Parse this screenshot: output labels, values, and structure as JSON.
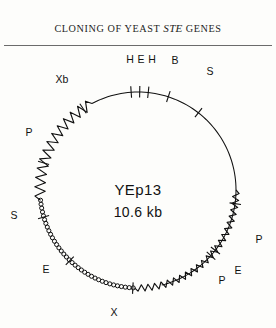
{
  "header": {
    "running_head_prefix": "CLONING OF YEAST ",
    "running_head_italic": "STE",
    "running_head_suffix": " GENES",
    "rule_color": "#6b6b6b"
  },
  "figure": {
    "plasmid_name": "YEp13",
    "plasmid_size": "10.6 kb",
    "stroke_color": "#111111",
    "background": "#fdfdfb",
    "circle": {
      "cx": 138,
      "cy": 142,
      "r": 98
    },
    "segment_styles": [
      {
        "name": "smooth-line",
        "description": "plain thin circle arc",
        "from_deg": -76,
        "to_deg": 118
      },
      {
        "name": "beaded-chain",
        "description": "chain of small open circles",
        "from_deg": 186,
        "to_deg": 268
      },
      {
        "name": "zigzag-large",
        "description": "large amplitude zig-zag",
        "from_deg": 118,
        "to_deg": 186
      },
      {
        "name": "zigzag-small",
        "description": "small amplitude wave",
        "from_deg": 268,
        "to_deg": 360
      }
    ],
    "site_labels": [
      {
        "id": "site-h-left",
        "text": "H",
        "angle_deg": 84,
        "x": 130,
        "y": 12
      },
      {
        "id": "site-e-top",
        "text": "E",
        "angle_deg": 89,
        "x": 141,
        "y": 12
      },
      {
        "id": "site-h-right",
        "text": "H",
        "angle_deg": 94,
        "x": 152,
        "y": 12
      },
      {
        "id": "site-b",
        "text": "B",
        "angle_deg": 72,
        "x": 175,
        "y": 13
      },
      {
        "id": "site-s-upper-right",
        "text": "S",
        "angle_deg": 52,
        "x": 210,
        "y": 24
      },
      {
        "id": "site-p-right",
        "text": "P",
        "angle_deg": 352,
        "x": 259,
        "y": 192
      },
      {
        "id": "site-p-lower-right",
        "text": "P",
        "angle_deg": 318,
        "x": 222,
        "y": 233
      },
      {
        "id": "site-e-lower-right",
        "text": "E",
        "angle_deg": 322,
        "x": 238,
        "y": 223
      },
      {
        "id": "site-x-bottom",
        "text": "X",
        "angle_deg": 267,
        "x": 114,
        "y": 265
      },
      {
        "id": "site-e-lower-left",
        "text": "E",
        "angle_deg": 226,
        "x": 46,
        "y": 222
      },
      {
        "id": "site-s-left",
        "text": "S",
        "angle_deg": 196,
        "x": 14,
        "y": 168
      },
      {
        "id": "site-p-upper-left",
        "text": "P",
        "angle_deg": 164,
        "x": 29,
        "y": 85
      },
      {
        "id": "site-xb",
        "text": "Xb",
        "angle_deg": 124,
        "x": 62,
        "y": 32
      }
    ]
  }
}
